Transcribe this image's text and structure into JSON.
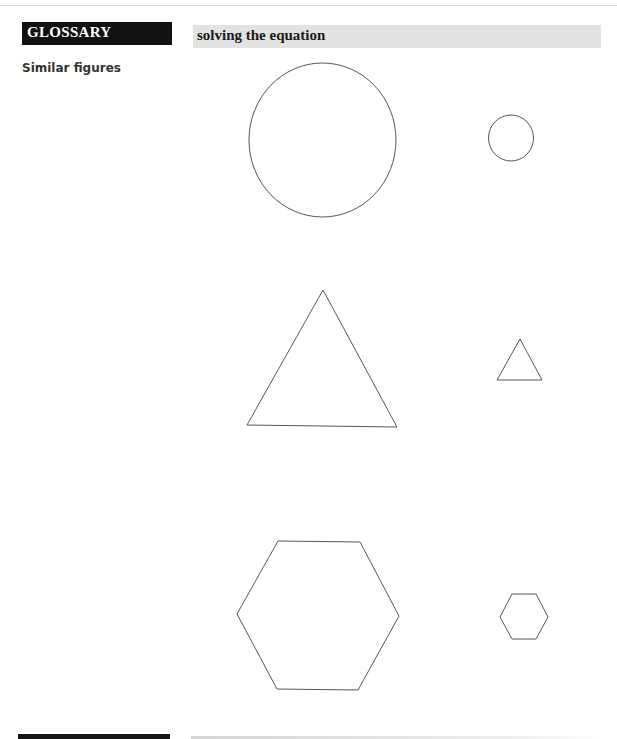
{
  "header": {
    "section_label": "GLOSSARY",
    "topic_title": "solving the equation"
  },
  "glossary_term": "Similar figures",
  "figures": {
    "stroke_color": "#555555",
    "pairs": [
      {
        "shape": "circle",
        "large": {
          "cx": 322.5,
          "cy": 140,
          "rx": 73.5,
          "ry": 77
        },
        "small": {
          "cx": 511,
          "cy": 138,
          "rx": 22.5,
          "ry": 23
        }
      },
      {
        "shape": "triangle",
        "large": {
          "points": "323,290 397,427 247,425"
        },
        "small": {
          "points": "520,339 542,380 497,380"
        }
      },
      {
        "shape": "hexagon",
        "large": {
          "points": "278,541 360,542 399,616 358,690 277,689 237,614"
        },
        "small": {
          "points": "512,594 536,594 548,617 536,639 512,639 500,617"
        }
      }
    ]
  }
}
